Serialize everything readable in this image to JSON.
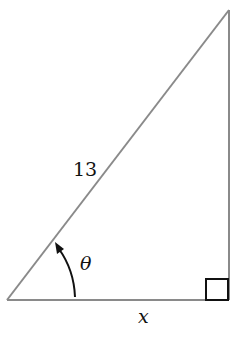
{
  "diagram": {
    "type": "right-triangle",
    "labels": {
      "hypotenuse": "13",
      "angle": "θ",
      "base": "x"
    },
    "vertices": {
      "left": [
        7,
        300
      ],
      "right_angle": [
        229,
        300
      ],
      "top": [
        229,
        10
      ]
    },
    "colors": {
      "line": "#8a8a8a",
      "square": "#111111",
      "arrow": "#111111"
    }
  }
}
